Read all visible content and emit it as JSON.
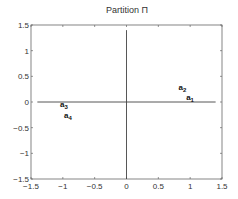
{
  "chart_data": {
    "type": "scatter",
    "title": "Partition Π",
    "xlabel": "",
    "ylabel": "",
    "xlim": [
      -1.5,
      1.5
    ],
    "ylim": [
      -1.5,
      1.5
    ],
    "x_ticks": [
      -1.5,
      -1,
      -0.5,
      0,
      0.5,
      1,
      1.5
    ],
    "x_tick_labels": [
      "-1.5",
      "-1",
      "-0.5",
      "0",
      "0.5",
      "1",
      "1.5"
    ],
    "y_ticks": [
      1.5,
      1,
      0.5,
      0,
      -0.5,
      -1,
      -1.5
    ],
    "y_tick_labels": [
      "1.5",
      "1",
      "0.5",
      "0",
      "-0.5",
      "-1",
      "-1.5"
    ],
    "grid": false,
    "legend": null,
    "reference_lines": [
      {
        "orientation": "horizontal",
        "y": 0,
        "x_from": -1.4,
        "x_to": 1.4
      },
      {
        "orientation": "vertical",
        "x": 0,
        "y_from": -1.5,
        "y_to": 1.4
      }
    ],
    "points": [
      {
        "label": "a",
        "subscript": "1",
        "x": 1.0,
        "y": 0.08
      },
      {
        "label": "a",
        "subscript": "2",
        "x": 0.88,
        "y": 0.27
      },
      {
        "label": "a",
        "subscript": "3",
        "x": -0.98,
        "y": -0.05
      },
      {
        "label": "a",
        "subscript": "4",
        "x": -0.92,
        "y": -0.27
      }
    ]
  },
  "colors": {
    "axis": "#555555",
    "line": "#444444",
    "text": "#333333"
  }
}
